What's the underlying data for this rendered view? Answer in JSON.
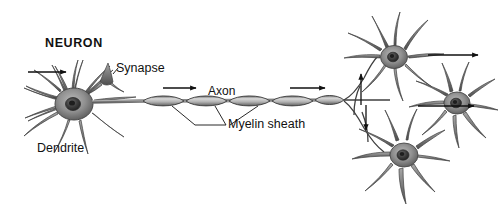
{
  "figure": {
    "title": "NEURON",
    "style": "grayscale-pencil-illustration",
    "background_color": "#ffffff",
    "ink_color": "#111111",
    "cell_fill_color": "#8d8d8d",
    "cell_shade_color": "#5a5a5a",
    "nucleus_color": "#3a3a3a",
    "width": 498,
    "height": 216
  },
  "labels": {
    "neuron": "NEURON",
    "synapse": "Synapse",
    "dendrite": "Dendrite",
    "axon": "Axon",
    "myelin_sheath": "Myelin sheath"
  },
  "parts": [
    {
      "name": "cell-body",
      "label": "",
      "note": "soma with dark nucleus, left side"
    },
    {
      "name": "dendrites",
      "label": "Dendrite",
      "note": "radiating branched processes around soma"
    },
    {
      "name": "synapse",
      "label": "Synapse",
      "note": "small terminal knob on upper dendrite"
    },
    {
      "name": "axon",
      "label": "Axon",
      "note": "long fiber extending to the right"
    },
    {
      "name": "myelin-sheath",
      "label": "Myelin sheath",
      "note": "five lens-shaped segments along axon"
    },
    {
      "name": "axon-terminals",
      "label": "",
      "note": "branches contacting three receiving neurons at right"
    }
  ],
  "direction_arrows": {
    "count": 6,
    "meaning": "signal-propagation-direction",
    "positions": [
      "incoming to left dendrite",
      "along proximal axon",
      "along distal axon",
      "upward into upper-right neuron",
      "rightward from upper-right neuron",
      "rightward from lower-right neuron"
    ]
  },
  "myelin_segments": 5,
  "receiving_neurons": 3
}
